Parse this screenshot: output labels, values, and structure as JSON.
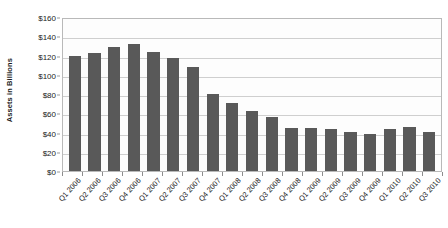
{
  "chart_data": {
    "type": "bar",
    "title": "",
    "xlabel": "",
    "ylabel": "Assets in Billions",
    "ylim": [
      0,
      160
    ],
    "ytick_values": [
      0,
      20,
      40,
      60,
      80,
      100,
      120,
      140,
      160
    ],
    "ytick_labels": [
      "$0",
      "$20",
      "$40",
      "$60",
      "$80",
      "$100",
      "$120",
      "$140",
      "$160"
    ],
    "grid": true,
    "legend": false,
    "bar_color": "#595959",
    "plot_background": "#fdfdfd",
    "gridline_color": "#cfcfcf",
    "categories": [
      "Q1 2006",
      "Q2 2006",
      "Q3 2006",
      "Q4 2006",
      "Q1 2007",
      "Q2 2007",
      "Q3 2007",
      "Q4 2007",
      "Q1 2008",
      "Q2 2008",
      "Q3 2008",
      "Q4 2008",
      "Q1 2009",
      "Q2 2009",
      "Q3 2009",
      "Q4 2009",
      "Q1 2010",
      "Q2 2010",
      "Q3 2010"
    ],
    "values": [
      121,
      124,
      131,
      134,
      125,
      119,
      109,
      81,
      72,
      63,
      57,
      45,
      45,
      44,
      41,
      39,
      44,
      46,
      41
    ]
  }
}
